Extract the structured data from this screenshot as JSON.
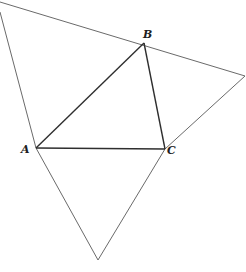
{
  "figure": {
    "vertices": {
      "A": {
        "label": "A"
      },
      "B": {
        "label": "B"
      },
      "C": {
        "label": "C"
      }
    },
    "inner_triangle": [
      "A",
      "B",
      "C"
    ],
    "outer_triangle_description": "Outer triangle whose sides pass through A, B and C",
    "caption": ""
  }
}
